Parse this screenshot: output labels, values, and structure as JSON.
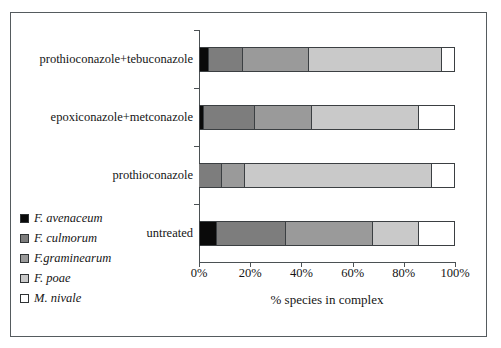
{
  "chart_data": {
    "type": "bar",
    "orientation": "horizontal",
    "stacked": true,
    "normalized": "percent",
    "title": "",
    "xlabel": "% species in complex",
    "ylabel": "",
    "xlim": [
      0,
      100
    ],
    "xticks": [
      0,
      20,
      40,
      60,
      80,
      100
    ],
    "xticklabels": [
      "0%",
      "20%",
      "40%",
      "60%",
      "80%",
      "100%"
    ],
    "grid": false,
    "legend_position": "bottom-left-outside",
    "categories": [
      "untreated",
      "prothioconazole",
      "epoxiconazole+metconazole",
      "prothioconazole+tebuconazole"
    ],
    "series": [
      {
        "name": "F. avenaceum",
        "color": "#0a0a0a",
        "values": [
          7,
          0,
          2,
          4
        ]
      },
      {
        "name": "F. culmorum",
        "color": "#7d7d7d",
        "values": [
          27,
          9,
          20,
          13
        ]
      },
      {
        "name": "F.graminearum",
        "color": "#9a9a9a",
        "values": [
          34,
          9,
          22,
          26
        ]
      },
      {
        "name": "F. poae",
        "color": "#c9c9c9",
        "values": [
          18,
          73,
          42,
          52
        ]
      },
      {
        "name": "M. nivale",
        "color": "#ffffff",
        "values": [
          14,
          9,
          14,
          5
        ]
      }
    ]
  },
  "legend": {
    "items": [
      {
        "label": "F. avenaceum",
        "swatch": "#0a0a0a"
      },
      {
        "label": "F. culmorum",
        "swatch": "#7d7d7d"
      },
      {
        "label": "F.graminearum",
        "swatch": "#9a9a9a"
      },
      {
        "label": "F. poae",
        "swatch": "#c9c9c9"
      },
      {
        "label": "M. nivale",
        "swatch": "#ffffff"
      }
    ]
  },
  "axis": {
    "x_title": "% species in complex",
    "tick_labels": [
      "0%",
      "20%",
      "40%",
      "60%",
      "80%",
      "100%"
    ]
  },
  "categories": {
    "labels": [
      "untreated",
      "prothioconazole",
      "epoxiconazole+metconazole",
      "prothioconazole+tebuconazole"
    ]
  },
  "colors": {
    "axis_line": "#4b5154",
    "bar_outline": "#3b3f42",
    "frame": "#555b5e",
    "text": "#151515"
  }
}
